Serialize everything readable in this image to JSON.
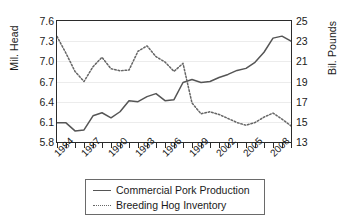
{
  "chart_data": {
    "type": "line",
    "title": "",
    "xlabel": "",
    "ylabel": "Mil. Head",
    "ylabel_secondary": "Bil. Pounds",
    "grid": true,
    "legend_position": "bottom",
    "x": [
      1984,
      1985,
      1986,
      1987,
      1988,
      1989,
      1990,
      1991,
      1992,
      1993,
      1994,
      1995,
      1996,
      1997,
      1998,
      1999,
      2000,
      2001,
      2002,
      2003,
      2004,
      2005,
      2006,
      2007,
      2008,
      2009,
      2010
    ],
    "xtick_labels": [
      "1984",
      "1987",
      "1990",
      "1993",
      "1996",
      "1999",
      "2002",
      "2005",
      "2008"
    ],
    "xtick_values": [
      1984,
      1987,
      1990,
      1993,
      1996,
      1999,
      2002,
      2005,
      2008
    ],
    "ylim": [
      5.8,
      7.6
    ],
    "ytick_labels": [
      "5.8",
      "6.1",
      "6.4",
      "6.7",
      "7.0",
      "7.3",
      "7.6"
    ],
    "ytick_values": [
      5.8,
      6.1,
      6.4,
      6.7,
      7.0,
      7.3,
      7.6
    ],
    "ylim_secondary": [
      13,
      25
    ],
    "ytick_labels_secondary": [
      "13",
      "15",
      "17",
      "19",
      "21",
      "23",
      "25"
    ],
    "ytick_values_secondary": [
      13,
      15,
      17,
      19,
      21,
      23,
      25
    ],
    "series": [
      {
        "name": "Commercial Pork Production",
        "axis": "right",
        "unit": "Bil. Pounds",
        "style": "solid",
        "color": "#555555",
        "values": [
          14.9,
          14.9,
          14.1,
          14.2,
          15.6,
          15.9,
          15.4,
          16.0,
          17.1,
          17.0,
          17.5,
          17.8,
          17.1,
          17.2,
          18.9,
          19.2,
          18.9,
          19.0,
          19.4,
          19.7,
          20.1,
          20.3,
          20.9,
          21.9,
          23.3,
          23.5,
          23.0
        ]
      },
      {
        "name": "Breeding Hog Inventory",
        "axis": "left",
        "unit": "Mil. Head",
        "style": "dotted",
        "color": "#666666",
        "values": [
          7.37,
          7.12,
          6.85,
          6.7,
          6.92,
          7.06,
          6.89,
          6.86,
          6.87,
          7.15,
          7.23,
          7.07,
          6.99,
          6.85,
          6.97,
          6.38,
          6.22,
          6.25,
          6.21,
          6.15,
          6.09,
          6.05,
          6.09,
          6.17,
          6.23,
          6.14,
          6.04
        ]
      }
    ]
  },
  "axes": {
    "left_label": "Mil. Head",
    "right_label": "Bil. Pounds"
  },
  "legend": {
    "entries": [
      {
        "label": "Commercial Pork Production",
        "style": "solid"
      },
      {
        "label": "Breeding Hog Inventory",
        "style": "dotted"
      }
    ]
  },
  "colors": {
    "solid_series": "#555555",
    "dotted_series": "#666666",
    "axis": "#2b2b2b",
    "grid": "#ececec"
  }
}
